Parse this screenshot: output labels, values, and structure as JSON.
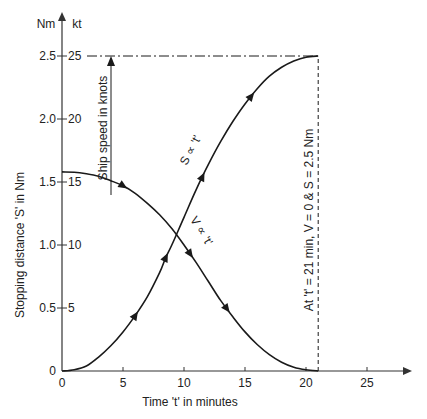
{
  "chart_data": {
    "type": "line",
    "title": "",
    "xlabel": "Time 't' in minutes",
    "ylabel": "Stopping distance 'S' in Nm",
    "ylabel_secondary": "Ship speed in knots",
    "y_unit_left": "Nm",
    "y_unit_right": "kt",
    "xlim": [
      0,
      28
    ],
    "ylim": [
      0,
      2.7
    ],
    "x_ticks": [
      0,
      5,
      10,
      15,
      20,
      25
    ],
    "y_ticks_left": [
      "0",
      "0.5",
      "1.0",
      "1.5",
      "2.0",
      "2.5"
    ],
    "y_ticks_right": [
      "",
      "5",
      "10",
      "15",
      "20",
      "25"
    ],
    "y_tick_values": [
      0,
      0.5,
      1.0,
      1.5,
      2.0,
      2.5
    ],
    "grid": false,
    "series": [
      {
        "name": "S ∝ 't'",
        "label": "S ∝ 't'",
        "x": [
          0,
          1,
          2,
          3,
          4,
          5,
          6,
          7,
          8,
          8.5,
          9,
          10,
          11,
          12,
          13,
          14,
          15,
          16,
          17,
          18,
          19,
          20,
          21
        ],
        "values": [
          0,
          0.01,
          0.04,
          0.11,
          0.2,
          0.31,
          0.44,
          0.59,
          0.78,
          0.9,
          1.0,
          1.22,
          1.44,
          1.64,
          1.82,
          1.98,
          2.12,
          2.24,
          2.34,
          2.41,
          2.46,
          2.49,
          2.5
        ],
        "arrows_at": [
          6,
          8.5,
          11.5,
          15.5
        ]
      },
      {
        "name": "V ∝ 't'",
        "label": "V ∝ 't'",
        "x": [
          0,
          1,
          2,
          3,
          4,
          5,
          6,
          7,
          8,
          9,
          10,
          11,
          12,
          13,
          14,
          15,
          16,
          17,
          18,
          19,
          20,
          21
        ],
        "values": [
          1.58,
          1.578,
          1.565,
          1.545,
          1.51,
          1.47,
          1.41,
          1.33,
          1.24,
          1.13,
          1.0,
          0.86,
          0.71,
          0.56,
          0.43,
          0.31,
          0.21,
          0.13,
          0.07,
          0.03,
          0.01,
          0.0
        ],
        "arrows_at": [
          5,
          10.5,
          13.5
        ]
      }
    ],
    "annotations": [
      {
        "text": "At 't' = 21 min, V = 0 & S = 2.5 Nm",
        "x": 20,
        "y": 1.25,
        "rotation": -90
      },
      {
        "text": "Ship speed in knots",
        "x": 4,
        "y": 1.9,
        "rotation": -90
      },
      {
        "text": "S ∝ 't'",
        "x": 10,
        "y": 1.8,
        "rotation": -60
      },
      {
        "text": "V ∝ 't'",
        "x": 10.3,
        "y": 1.08,
        "rotation": 55
      }
    ],
    "reference_lines": [
      {
        "type": "horizontal",
        "style": "dash-dot",
        "y": 2.5,
        "from_x": 0,
        "to_x": 21
      },
      {
        "type": "vertical",
        "style": "dashed",
        "x": 21,
        "from_y": 0,
        "to_y": 2.5
      }
    ],
    "intersection": {
      "x": 9.3,
      "y": 1.18
    },
    "legend": "none"
  },
  "colors": {
    "line": "#1a1a1a",
    "axis": "#333333",
    "text": "#222222",
    "background": "#ffffff"
  }
}
